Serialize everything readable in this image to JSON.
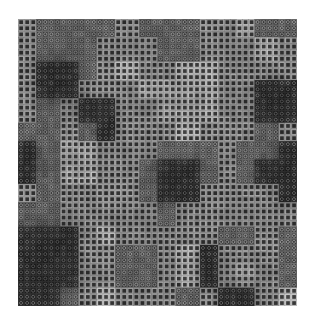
{
  "image": {
    "description": "Grayscale texture composed of a grid of small square cells; regions alternate between plain square cells and ring/dotted cells with dark and light blotches",
    "canvas": {
      "width": 312,
      "height": 322,
      "background": "#ffffff"
    },
    "texture": {
      "x": 18,
      "y": 19,
      "width": 279,
      "height": 287,
      "cell_pitch": 6.05,
      "cols": 46,
      "rows": 47
    },
    "palette": {
      "base": "#4a4a4a",
      "square_outline": "#9a9a9a",
      "square_outline_light": "#b8b8b8",
      "square_center": "#2e2e2e",
      "ring_outline": "#6c6c6c",
      "ring_inner": "#8f8f8f",
      "ring_center": "#3a3a3a",
      "dark_ring_outline": "#3c3c3c",
      "dark_ring_inner": "#7a7a7a",
      "dark_ring_center": "#222222"
    },
    "region_legend": {
      "s": "plain square cell",
      "S": "plain square cell, light",
      "R": "ring cell",
      "D": "ring cell, dark"
    },
    "region_map": [
      "sRRRRsRRRssSRR",
      "sRRRsssRRsssSs",
      "sDDRsSssSSssss",
      "sDDsssSSSSssDD",
      "sRsDDssSSSssDD",
      "RRsRDsssSsssRs",
      "DRSSsssRRRsRRD",
      "DRSSssRDDRsRDD",
      "sRssssRDDssssD",
      "RRsssssRssssss",
      "DDDsSsssssRRsR",
      "DDDssRRsSDsssR",
      "DDDssRRsSDsSsR",
      "DDRsSsssRsDDsS"
    ]
  }
}
